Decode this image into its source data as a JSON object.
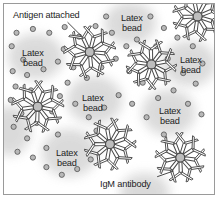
{
  "figure": {
    "type": "diagram",
    "border_color": "#9a9a9a",
    "background_color": "#ffffff"
  },
  "labels": {
    "antigen_attached": "Antigen attached",
    "igm_antibody": "IgM antibody",
    "latex_bead_line1": "Latex",
    "latex_bead_line2": "bead"
  },
  "callouts": [
    {
      "name": "antigen-attached-callout",
      "text": "Antigen attached",
      "x": 9,
      "y": 7,
      "leader": {
        "x1": 66,
        "y1": 19,
        "x2": 80,
        "y2": 33
      }
    },
    {
      "name": "igm-antibody-callout",
      "text": "IgM antibody",
      "x": 96,
      "y": 176,
      "leader": {
        "x1": 159,
        "y1": 180,
        "x2": 176,
        "y2": 174
      }
    }
  ],
  "bead_labels": [
    {
      "name": "latex-bead-label-top-center",
      "x": 117,
      "y": 10
    },
    {
      "name": "latex-bead-label-left",
      "x": 18,
      "y": 45
    },
    {
      "name": "latex-bead-label-right",
      "x": 176,
      "y": 52
    },
    {
      "name": "latex-bead-label-center",
      "x": 78,
      "y": 90
    },
    {
      "name": "latex-bead-label-mid-right",
      "x": 155,
      "y": 103
    },
    {
      "name": "latex-bead-label-bottom-left",
      "x": 52,
      "y": 145
    }
  ],
  "colors": {
    "antigen_fill": "#b8b8b8",
    "antigen_stroke": "#5a5a5a",
    "antibody_stroke": "#4a4a4a",
    "antibody_fill": "#ffffff",
    "hub_fill": "#bdbdbd",
    "bead_fill": "#d9d9d9",
    "text": "#1c1c1c"
  },
  "counts": {
    "igm_antibodies": 6,
    "labeled_latex_beads": 6,
    "antigen_particles": 62
  },
  "elements": {
    "igm_stars": [
      {
        "name": "igm-star-top-right",
        "cx": 201,
        "cy": 13,
        "r": 26,
        "arms": 9,
        "rot": 18
      },
      {
        "name": "igm-star-top-center",
        "cx": 89,
        "cy": 50,
        "r": 27,
        "arms": 9,
        "rot": 5
      },
      {
        "name": "igm-star-right",
        "cx": 153,
        "cy": 63,
        "r": 26,
        "arms": 9,
        "rot": 28
      },
      {
        "name": "igm-star-left",
        "cx": 35,
        "cy": 107,
        "r": 27,
        "arms": 9,
        "rot": 12
      },
      {
        "name": "igm-star-bottom-center",
        "cx": 110,
        "cy": 146,
        "r": 27,
        "arms": 9,
        "rot": 20
      },
      {
        "name": "igm-star-bottom-right",
        "cx": 183,
        "cy": 160,
        "r": 26,
        "arms": 9,
        "rot": 8
      }
    ],
    "beads": [
      {
        "name": "bead-blob-top-center",
        "cx": 131,
        "cy": 20,
        "rx": 27,
        "ry": 22
      },
      {
        "name": "bead-blob-left",
        "cx": 33,
        "cy": 55,
        "rx": 29,
        "ry": 24
      },
      {
        "name": "bead-blob-right",
        "cx": 192,
        "cy": 62,
        "rx": 28,
        "ry": 24
      },
      {
        "name": "bead-blob-center",
        "cx": 94,
        "cy": 100,
        "rx": 29,
        "ry": 25
      },
      {
        "name": "bead-blob-mid-right",
        "cx": 171,
        "cy": 113,
        "rx": 28,
        "ry": 24
      },
      {
        "name": "bead-blob-bottom-left",
        "cx": 68,
        "cy": 155,
        "rx": 29,
        "ry": 25
      },
      {
        "name": "bead-blob-left-edge",
        "cx": 6,
        "cy": 132,
        "rx": 22,
        "ry": 26
      },
      {
        "name": "bead-blob-bottom-edge",
        "cx": 146,
        "cy": 196,
        "rx": 26,
        "ry": 20
      }
    ],
    "antigens": [
      {
        "cx": 13,
        "cy": 30
      },
      {
        "cx": 30,
        "cy": 26
      },
      {
        "cx": 47,
        "cy": 30
      },
      {
        "cx": 63,
        "cy": 24
      },
      {
        "cx": 78,
        "cy": 34
      },
      {
        "cx": 95,
        "cy": 23
      },
      {
        "cx": 112,
        "cy": 30
      },
      {
        "cx": 106,
        "cy": 13
      },
      {
        "cx": 152,
        "cy": 13
      },
      {
        "cx": 166,
        "cy": 25
      },
      {
        "cx": 180,
        "cy": 35
      },
      {
        "cx": 196,
        "cy": 44
      },
      {
        "cx": 8,
        "cy": 44
      },
      {
        "cx": 20,
        "cy": 58
      },
      {
        "cx": 9,
        "cy": 70
      },
      {
        "cx": 24,
        "cy": 74
      },
      {
        "cx": 41,
        "cy": 68
      },
      {
        "cx": 56,
        "cy": 60
      },
      {
        "cx": 62,
        "cy": 47
      },
      {
        "cx": 72,
        "cy": 66
      },
      {
        "cx": 86,
        "cy": 77
      },
      {
        "cx": 101,
        "cy": 66
      },
      {
        "cx": 116,
        "cy": 57
      },
      {
        "cx": 127,
        "cy": 44
      },
      {
        "cx": 138,
        "cy": 37
      },
      {
        "cx": 130,
        "cy": 70
      },
      {
        "cx": 144,
        "cy": 82
      },
      {
        "cx": 158,
        "cy": 44
      },
      {
        "cx": 170,
        "cy": 57
      },
      {
        "cx": 186,
        "cy": 72
      },
      {
        "cx": 199,
        "cy": 83
      },
      {
        "cx": 206,
        "cy": 62
      },
      {
        "cx": 12,
        "cy": 86
      },
      {
        "cx": 28,
        "cy": 90
      },
      {
        "cx": 7,
        "cy": 100
      },
      {
        "cx": 18,
        "cy": 114
      },
      {
        "cx": 34,
        "cy": 124
      },
      {
        "cx": 50,
        "cy": 112
      },
      {
        "cx": 58,
        "cy": 96
      },
      {
        "cx": 66,
        "cy": 82
      },
      {
        "cx": 74,
        "cy": 104
      },
      {
        "cx": 88,
        "cy": 118
      },
      {
        "cx": 104,
        "cy": 108
      },
      {
        "cx": 119,
        "cy": 95
      },
      {
        "cx": 133,
        "cy": 104
      },
      {
        "cx": 148,
        "cy": 118
      },
      {
        "cx": 160,
        "cy": 98
      },
      {
        "cx": 176,
        "cy": 90
      },
      {
        "cx": 191,
        "cy": 104
      },
      {
        "cx": 205,
        "cy": 115
      },
      {
        "cx": 10,
        "cy": 128
      },
      {
        "cx": 24,
        "cy": 140
      },
      {
        "cx": 14,
        "cy": 154
      },
      {
        "cx": 30,
        "cy": 160
      },
      {
        "cx": 44,
        "cy": 170
      },
      {
        "cx": 60,
        "cy": 178
      },
      {
        "cx": 76,
        "cy": 172
      },
      {
        "cx": 90,
        "cy": 162
      },
      {
        "cx": 56,
        "cy": 136
      },
      {
        "cx": 44,
        "cy": 150
      },
      {
        "cx": 96,
        "cy": 132
      },
      {
        "cx": 166,
        "cy": 136
      }
    ]
  }
}
